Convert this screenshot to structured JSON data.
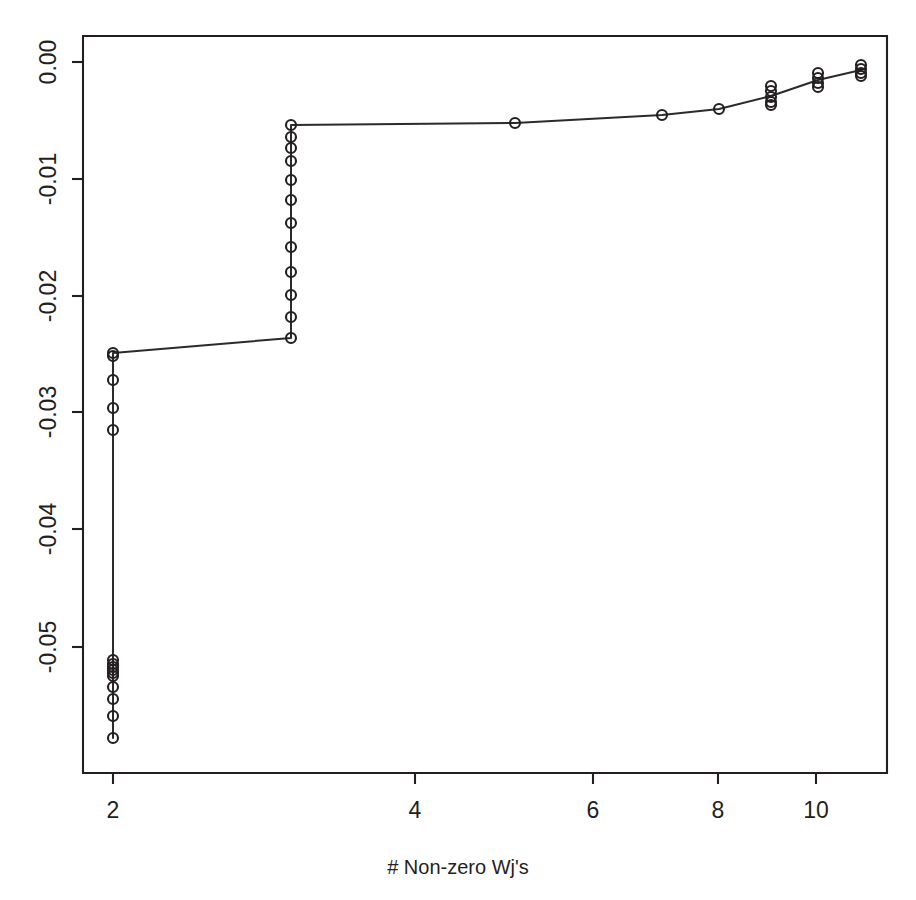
{
  "chart_data": {
    "type": "line",
    "title": "",
    "subtitle": "",
    "xlabel": "# Non-zero Wj's",
    "ylabel": "",
    "xscale": "log",
    "yscale": "linear",
    "grid": false,
    "legend": null,
    "xlim": [
      1.845,
      11.72
    ],
    "ylim": [
      -0.0605,
      0.0022
    ],
    "xticks": [
      2,
      4,
      6,
      8,
      10
    ],
    "xticklabels": [
      "2",
      "4",
      "6",
      "8",
      "10"
    ],
    "yticks": [
      0.0,
      -0.01,
      -0.02,
      -0.03,
      -0.04,
      -0.05
    ],
    "yticklabels": [
      "0.00",
      "-0.01",
      "-0.02",
      "-0.03",
      "-0.04",
      "-0.05"
    ],
    "marker": "open-circle",
    "marker_size": 5,
    "series": [
      {
        "name": "solution path",
        "x": [
          2.0,
          2.0,
          2.0,
          2.0,
          2.0,
          2.0,
          2.0,
          2.0,
          2.0,
          2.0,
          2.0,
          2.0,
          3.0,
          3.0,
          3.0,
          3.0,
          3.0,
          3.0,
          3.0,
          3.0,
          3.0,
          3.0,
          3.0,
          3.0,
          3.0,
          5.03,
          7.03,
          8.03,
          9.03,
          9.03,
          9.03,
          10.05,
          10.05,
          11.07,
          11.07
        ],
        "y": [
          -0.0605,
          -0.0575,
          -0.0556,
          -0.0537,
          -0.0524,
          -0.0517,
          -0.0512,
          -0.0509,
          -0.0313,
          -0.0294,
          -0.0271,
          -0.0247,
          -0.0231,
          -0.0217,
          -0.0199,
          -0.0181,
          -0.0163,
          -0.0145,
          -0.0127,
          -0.0113,
          -0.0099,
          -0.0085,
          -0.0073,
          -0.0063,
          -0.0053,
          -0.0052,
          -0.0045,
          -0.004,
          -0.0037,
          -0.003,
          -0.002,
          -0.0024,
          -0.0015,
          -0.001,
          -0.0006
        ]
      }
    ],
    "path_points": [
      {
        "x": 2.0,
        "y": -0.0605
      },
      {
        "x": 2.0,
        "y": -0.0242
      },
      {
        "x": 3.0,
        "y": -0.0231
      },
      {
        "x": 3.0,
        "y": -0.0053
      },
      {
        "x": 5.03,
        "y": -0.0052
      },
      {
        "x": 7.03,
        "y": -0.0045
      },
      {
        "x": 8.03,
        "y": -0.004
      },
      {
        "x": 9.03,
        "y": -0.003
      },
      {
        "x": 10.05,
        "y": -0.0019
      },
      {
        "x": 11.07,
        "y": -0.0008
      }
    ],
    "markers_px": [
      {
        "cx": 113,
        "cy": 353
      },
      {
        "cx": 113,
        "cy": 356
      },
      {
        "cx": 113,
        "cy": 380
      },
      {
        "cx": 113,
        "cy": 408
      },
      {
        "cx": 113,
        "cy": 430
      },
      {
        "cx": 113,
        "cy": 660
      },
      {
        "cx": 113,
        "cy": 664
      },
      {
        "cx": 113,
        "cy": 667
      },
      {
        "cx": 113,
        "cy": 670
      },
      {
        "cx": 113,
        "cy": 673
      },
      {
        "cx": 113,
        "cy": 676
      },
      {
        "cx": 113,
        "cy": 687
      },
      {
        "cx": 113,
        "cy": 699
      },
      {
        "cx": 113,
        "cy": 716
      },
      {
        "cx": 113,
        "cy": 738
      },
      {
        "cx": 291,
        "cy": 125
      },
      {
        "cx": 291,
        "cy": 137
      },
      {
        "cx": 291,
        "cy": 148
      },
      {
        "cx": 291,
        "cy": 161
      },
      {
        "cx": 291,
        "cy": 180
      },
      {
        "cx": 291,
        "cy": 200
      },
      {
        "cx": 291,
        "cy": 223
      },
      {
        "cx": 291,
        "cy": 247
      },
      {
        "cx": 291,
        "cy": 272
      },
      {
        "cx": 291,
        "cy": 295
      },
      {
        "cx": 291,
        "cy": 317
      },
      {
        "cx": 291,
        "cy": 338
      },
      {
        "cx": 515,
        "cy": 123
      },
      {
        "cx": 662,
        "cy": 115
      },
      {
        "cx": 719,
        "cy": 109
      },
      {
        "cx": 771,
        "cy": 86
      },
      {
        "cx": 771,
        "cy": 91
      },
      {
        "cx": 771,
        "cy": 97
      },
      {
        "cx": 771,
        "cy": 102
      },
      {
        "cx": 771,
        "cy": 105
      },
      {
        "cx": 818,
        "cy": 73
      },
      {
        "cx": 818,
        "cy": 78
      },
      {
        "cx": 818,
        "cy": 83
      },
      {
        "cx": 818,
        "cy": 87
      },
      {
        "cx": 861,
        "cy": 65
      },
      {
        "cx": 861,
        "cy": 69
      },
      {
        "cx": 861,
        "cy": 73
      },
      {
        "cx": 861,
        "cy": 76
      }
    ],
    "path_px": "M 113,738 L 113,353 L 291,338 L 291,125 L 515,123 L 662,115 L 719,109 L 771,96 L 818,80 L 861,70",
    "geometry": {
      "plot_left": 83,
      "plot_right": 887,
      "plot_top": 36,
      "plot_bottom": 773,
      "xtick_px": [
        113,
        415,
        593,
        718,
        816
      ],
      "ytick_px": [
        62,
        179,
        296,
        412,
        529,
        647
      ],
      "xlabel_px": {
        "x": 458,
        "y": 874
      },
      "tick_len": 11
    },
    "colors": {
      "axis": "#231f20",
      "line": "#2b2b2b",
      "marker": "#231f20",
      "background": "#ffffff"
    }
  }
}
